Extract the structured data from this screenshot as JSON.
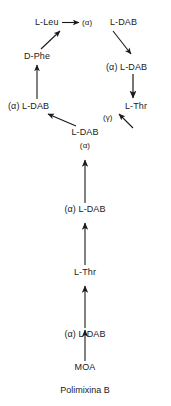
{
  "diagram": {
    "title_caption": "Polimixina B",
    "nodes": {
      "l_leu": "L-Leu",
      "alpha_top": "(α)",
      "l_dab_topright": "L-DAB",
      "d_phe": "D-Phe",
      "alpha_l_dab_right": "(α) L-DAB",
      "alpha_l_dab_left": "(α) L-DAB",
      "l_thr_right": "L-Thr",
      "gamma_right": "(γ)",
      "l_dab_center": "L-DAB",
      "alpha_center": "(α)",
      "alpha_l_dab_chain1": "(α) L-DAB",
      "l_thr_chain": "L-Thr",
      "alpha_l_dab_chain2": "(α) L-DAB",
      "moa": "MOA"
    }
  },
  "colors": {
    "ink": "#1a1a1a",
    "background": "#ffffff"
  }
}
